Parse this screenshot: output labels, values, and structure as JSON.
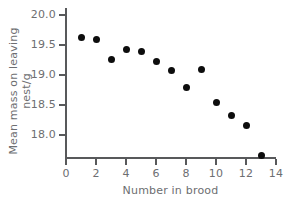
{
  "chart_data": {
    "type": "scatter",
    "title": "",
    "xlabel": "Number in brood",
    "ylabel": "Mean mass on leaving nest/g",
    "xlim": [
      0,
      14
    ],
    "ylim": [
      17.55,
      20.05
    ],
    "xticks": [
      "0",
      "2",
      "4",
      "6",
      "8",
      "10",
      "12",
      "14"
    ],
    "xtick_values": [
      0,
      2,
      4,
      6,
      8,
      10,
      12,
      14
    ],
    "yticks": [
      "20.0",
      "19.5",
      "19.0",
      "18.5",
      "18.0"
    ],
    "ytick_values": [
      20.0,
      19.5,
      19.0,
      18.5,
      18.0
    ],
    "grid": false,
    "legend": null,
    "x": [
      1,
      2,
      3,
      4,
      5,
      6,
      7,
      8,
      9,
      10,
      11,
      12,
      13
    ],
    "values": [
      19.62,
      19.59,
      19.26,
      19.43,
      19.4,
      19.23,
      19.08,
      18.8,
      19.1,
      18.55,
      18.33,
      18.16,
      17.66
    ],
    "points": [
      {
        "x": 1,
        "y": 19.62
      },
      {
        "x": 2,
        "y": 19.59
      },
      {
        "x": 3,
        "y": 19.26
      },
      {
        "x": 4,
        "y": 19.43
      },
      {
        "x": 5,
        "y": 19.4
      },
      {
        "x": 6,
        "y": 19.23
      },
      {
        "x": 7,
        "y": 19.08
      },
      {
        "x": 8,
        "y": 18.8
      },
      {
        "x": 9,
        "y": 19.1
      },
      {
        "x": 10,
        "y": 18.55
      },
      {
        "x": 11,
        "y": 18.33
      },
      {
        "x": 12,
        "y": 18.16
      },
      {
        "x": 13,
        "y": 17.66
      }
    ],
    "marker": {
      "shape": "circle",
      "color": "#0d0d0d",
      "size": 7
    },
    "axis_color": "#58595b",
    "label_color": "#6d6e71",
    "background": "#ffffff"
  }
}
